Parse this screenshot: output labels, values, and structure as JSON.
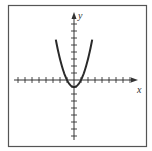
{
  "chart_data": {
    "type": "line",
    "title": "",
    "xlabel": "x",
    "ylabel": "y",
    "function": "y = x^2 - 1",
    "xlim": [
      -9,
      9
    ],
    "ylim": [
      -9,
      9
    ],
    "x_ticks_negative": 8,
    "x_ticks_positive": 8,
    "y_ticks_positive": 9,
    "y_ticks_negative": 9,
    "grid": false,
    "series": [
      {
        "name": "parabola",
        "x": [
          -2.6,
          -2,
          -1.5,
          -1,
          -0.5,
          0,
          0.5,
          1,
          1.5,
          2,
          2.6
        ],
        "y": [
          5.76,
          3,
          1.25,
          0,
          -0.75,
          -1,
          -0.75,
          0,
          1.25,
          3,
          5.76
        ]
      }
    ],
    "colors": {
      "curve": "#2a2a2a",
      "axes": "#333333",
      "frame": "#555555"
    }
  },
  "labels": {
    "x_axis": "x",
    "y_axis": "y"
  }
}
